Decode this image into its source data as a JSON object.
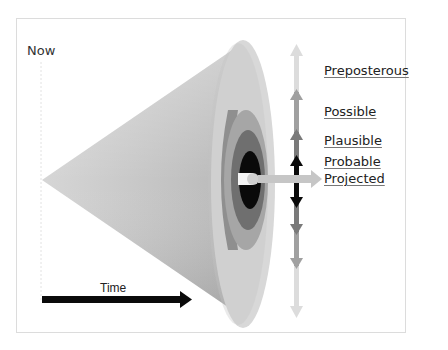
{
  "diagram": {
    "axis": {
      "start_label": "Now",
      "time_label": "Time"
    },
    "futures": [
      {
        "label": "Preposterous",
        "color": "#d9d9d9"
      },
      {
        "label": "Possible",
        "color": "#a6a6a6"
      },
      {
        "label": "Plausible",
        "color": "#7f7f7f"
      },
      {
        "label": "Probable",
        "color": "#0d0d0d"
      },
      {
        "label": "Projected",
        "color": "#c8c8c8"
      }
    ]
  }
}
